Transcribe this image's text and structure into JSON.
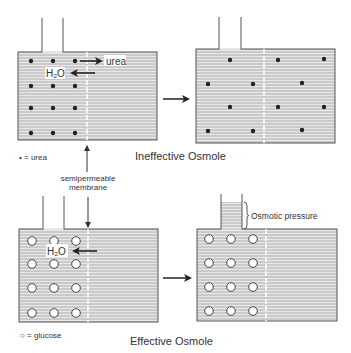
{
  "colors": {
    "line": "#555555",
    "fluid": "#e3e3e3",
    "hatch": "#9a9a9a",
    "dot": "#222222",
    "text": "#333333",
    "arrow": "#222222",
    "membrane": "#ffffff"
  },
  "panels": {
    "ineffective": {
      "title": "Ineffective Osmole",
      "legend": "• = urea",
      "before": {
        "particle": "urea-dot",
        "flux_labels": {
          "solute": "urea",
          "water": "H₂O"
        }
      },
      "after": {
        "particle": "urea-dot"
      }
    },
    "effective": {
      "title": "Effective Osmole",
      "legend": "○ = glucose",
      "membrane_label_line1": "semipermeable",
      "membrane_label_line2": "membrane",
      "before": {
        "particle": "glucose-circle",
        "flux_labels": {
          "water": "H₂O"
        }
      },
      "after": {
        "particle": "glucose-circle",
        "pressure_label": "Osmotic pressure"
      }
    }
  }
}
